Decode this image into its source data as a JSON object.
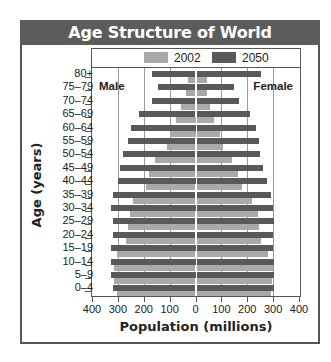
{
  "title": "Age Structure of World Population",
  "legend": [
    {
      "label": "2002",
      "color": "#a9a9a9"
    },
    {
      "label": "2050",
      "color": "#595959"
    }
  ],
  "labels": {
    "male": "Male",
    "female": "Female"
  },
  "xlabel": "Population (millions)",
  "ylabel": "Age (years)",
  "x_ticks": [
    "400",
    "300",
    "200",
    "100",
    "0",
    "100",
    "200",
    "300",
    "400"
  ],
  "chart_data": {
    "type": "bar",
    "subtype": "population-pyramid",
    "title": "Age Structure of World Population",
    "xlabel": "Population (millions)",
    "ylabel": "Age (years)",
    "xlim": [
      -400,
      400
    ],
    "x_ticks": [
      -400,
      -300,
      -200,
      -100,
      0,
      100,
      200,
      300,
      400
    ],
    "grid": true,
    "legend_position": "top",
    "annotations": [
      "Male",
      "Female"
    ],
    "categories": [
      "80+",
      "75–79",
      "70–74",
      "65–69",
      "60–64",
      "55–59",
      "50–54",
      "45–49",
      "40–44",
      "35–39",
      "30–34",
      "25–29",
      "20–24",
      "15–19",
      "10–14",
      "5–9",
      "0–4"
    ],
    "series": [
      {
        "name": "2002 Male",
        "values": [
          30,
          35,
          55,
          75,
          100,
          110,
          155,
          180,
          190,
          240,
          255,
          260,
          270,
          305,
          315,
          315,
          305
        ]
      },
      {
        "name": "2002 Female",
        "values": [
          45,
          45,
          55,
          70,
          95,
          105,
          140,
          165,
          180,
          220,
          240,
          245,
          255,
          280,
          300,
          295,
          290
        ]
      },
      {
        "name": "2050 Male",
        "values": [
          170,
          145,
          170,
          220,
          250,
          260,
          280,
          290,
          300,
          320,
          325,
          320,
          320,
          325,
          325,
          325,
          320
        ]
      },
      {
        "name": "2050 Female",
        "values": [
          255,
          150,
          170,
          210,
          235,
          245,
          250,
          260,
          275,
          290,
          300,
          305,
          300,
          300,
          305,
          305,
          305
        ]
      }
    ]
  }
}
